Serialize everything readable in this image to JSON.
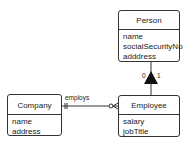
{
  "diagram": {
    "classes": {
      "person": {
        "name": "Person",
        "attributes": [
          "name",
          "socialSecurityNo",
          "adddress"
        ]
      },
      "company": {
        "name": "Company",
        "attributes": [
          "name",
          "address"
        ]
      },
      "employee": {
        "name": "Employee",
        "attributes": [
          "salary",
          "jobTitle"
        ]
      }
    },
    "relationships": {
      "employs": {
        "label": "employs",
        "from": "Company",
        "to": "Employee",
        "from_cardinality": "one-and-only-one",
        "to_cardinality": "zero-or-many"
      },
      "inheritance": {
        "from": "Employee",
        "to": "Person",
        "left_label": "0",
        "right_label": "1"
      }
    }
  }
}
